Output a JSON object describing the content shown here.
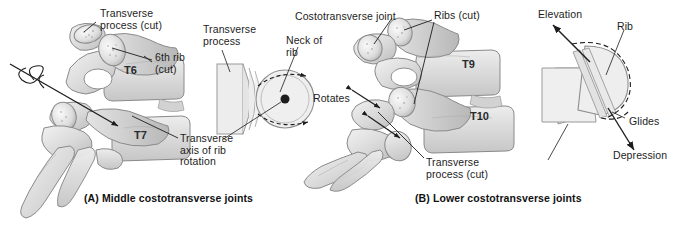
{
  "figure": {
    "background_color": "#ffffff",
    "ink_color": "#1d1d1d",
    "bone_fill": "#d8d8d8",
    "bone_fill_light": "#ebebeb",
    "bone_outline": "#7a7a7a"
  },
  "panel_a": {
    "caption": "(A) Middle costotransverse joints",
    "labels": {
      "transverse_process_cut": "Transverse\nprocess (cut)",
      "sixth_rib_cut": "6th rib\n(cut)",
      "transverse_axis": "Transverse\naxis of rib\nrotation"
    },
    "vertebra_labels": [
      "T6",
      "T7"
    ],
    "schematic": {
      "transverse_process": "Transverse\nprocess",
      "neck_of_rib": "Neck of\nrib",
      "motion": "Rotates"
    }
  },
  "panel_b": {
    "caption": "(B) Lower costotransverse joints",
    "labels": {
      "costotransverse_joint": "Costotransverse joint",
      "ribs_cut": "Ribs (cut)",
      "transverse_process_cut": "Transverse\nprocess (cut)"
    },
    "vertebra_labels": [
      "T9",
      "T10"
    ],
    "schematic": {
      "rib": "Rib",
      "motion_up": "Elevation",
      "motion_slide": "Glides",
      "motion_down": "Depression"
    }
  }
}
